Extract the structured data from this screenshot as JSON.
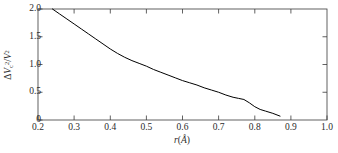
{
  "chart_data": {
    "type": "line",
    "title": "",
    "xlabel": "r(Å)",
    "ylabel": "ΔV²c/V²",
    "xlim": [
      0.2,
      1.0
    ],
    "ylim": [
      0.0,
      2.0
    ],
    "xticks": [
      "0.2",
      "0.3",
      "0.4",
      "0.5",
      "0.6",
      "0.7",
      "0.8",
      "0.9",
      "1.0"
    ],
    "xtick_values": [
      0.2,
      0.3,
      0.4,
      0.5,
      0.6,
      0.7,
      0.8,
      0.9,
      1.0
    ],
    "yticks": [
      "0",
      "0.5",
      "1.0",
      "1.5",
      "2.0"
    ],
    "ytick_values": [
      0.0,
      0.5,
      1.0,
      1.5,
      2.0
    ],
    "grid": false,
    "legend": null,
    "line_color": "#000000",
    "line_width": 1.0,
    "x": [
      0.24,
      0.26,
      0.28,
      0.3,
      0.32,
      0.34,
      0.36,
      0.38,
      0.4,
      0.42,
      0.44,
      0.46,
      0.48,
      0.5,
      0.52,
      0.54,
      0.56,
      0.58,
      0.6,
      0.62,
      0.64,
      0.66,
      0.68,
      0.7,
      0.72,
      0.74,
      0.755,
      0.77,
      0.785,
      0.8,
      0.815,
      0.83,
      0.85,
      0.87
    ],
    "values": [
      2.0,
      1.91,
      1.82,
      1.73,
      1.64,
      1.55,
      1.46,
      1.37,
      1.28,
      1.2,
      1.13,
      1.07,
      1.02,
      0.97,
      0.91,
      0.86,
      0.81,
      0.76,
      0.71,
      0.67,
      0.63,
      0.58,
      0.54,
      0.5,
      0.45,
      0.41,
      0.39,
      0.37,
      0.31,
      0.24,
      0.19,
      0.16,
      0.12,
      0.07
    ],
    "series": [
      {
        "name": "ΔV²c/V² vs r",
        "x": [
          0.24,
          0.26,
          0.28,
          0.3,
          0.32,
          0.34,
          0.36,
          0.38,
          0.4,
          0.42,
          0.44,
          0.46,
          0.48,
          0.5,
          0.52,
          0.54,
          0.56,
          0.58,
          0.6,
          0.62,
          0.64,
          0.66,
          0.68,
          0.7,
          0.72,
          0.74,
          0.755,
          0.77,
          0.785,
          0.8,
          0.815,
          0.83,
          0.85,
          0.87
        ],
        "values": [
          2.0,
          1.91,
          1.82,
          1.73,
          1.64,
          1.55,
          1.46,
          1.37,
          1.28,
          1.2,
          1.13,
          1.07,
          1.02,
          0.97,
          0.91,
          0.86,
          0.81,
          0.76,
          0.71,
          0.67,
          0.63,
          0.58,
          0.54,
          0.5,
          0.45,
          0.41,
          0.39,
          0.37,
          0.31,
          0.24,
          0.19,
          0.16,
          0.12,
          0.07
        ]
      }
    ]
  },
  "axis": {
    "x_title_var": "r",
    "x_title_open": "(",
    "x_title_unit": "Å",
    "x_title_close": ")",
    "y_title_delta": "Δ",
    "y_title_var": "V",
    "y_title_sub": "c",
    "y_title_sup": "2",
    "y_title_slash": "/",
    "y_title_var2": "V",
    "y_title_sup2": "2"
  }
}
